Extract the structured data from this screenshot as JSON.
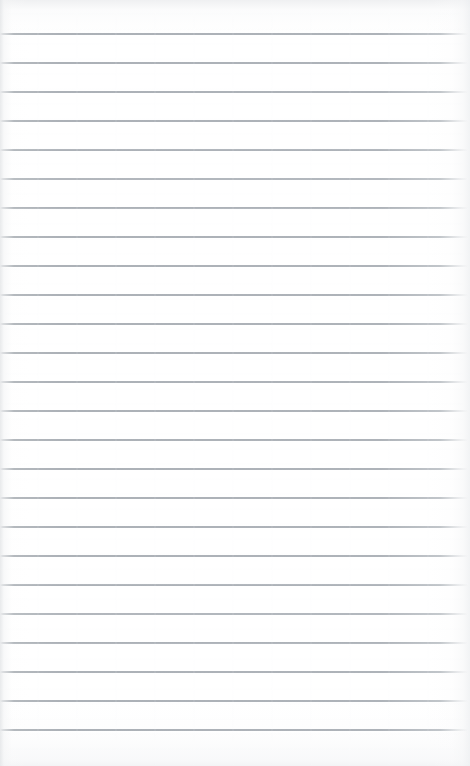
{
  "document": {
    "type": "lined-notepad-page",
    "title": "Blank ruled notepad page",
    "orientation": "portrait",
    "width_px": 470,
    "height_px": 766,
    "content_text": "",
    "has_written_content": false,
    "written_lines": []
  },
  "paper": {
    "background_color": "#ffffff",
    "edge_shadow_color": "#e8eaec",
    "texture": "smooth",
    "margin_rule": "none",
    "holes": "none"
  },
  "ruling": {
    "style": "wide-ruled horizontal lines",
    "line_color": "#aeb3b9",
    "line_thickness_px": 1,
    "line_spacing_px": 29,
    "first_line_y_px": 33,
    "line_count": 25,
    "line_start_x_px": 2,
    "line_end_x_px": 466,
    "line_y_positions": [
      33,
      62,
      91,
      120,
      149,
      178,
      207,
      236,
      265,
      294,
      323,
      352,
      381,
      410,
      439,
      468,
      497,
      526,
      555,
      584,
      613,
      642,
      671,
      700,
      729
    ],
    "bottom_margin_px": 37,
    "top_margin_px": 33
  }
}
